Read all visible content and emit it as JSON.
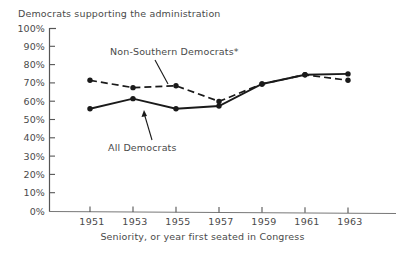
{
  "chart_data": {
    "type": "line",
    "title": "Democrats supporting the administration",
    "xlabel": "Seniority, or year first seated in Congress",
    "ylabel": "",
    "categories": [
      "1951",
      "1953",
      "1955",
      "1957",
      "1959",
      "1961",
      "1963"
    ],
    "x": [
      1951,
      1953,
      1955,
      1957,
      1959,
      1961,
      1963
    ],
    "ylim": [
      0,
      100
    ],
    "ytick_labels": [
      "0%",
      "10%",
      "20%",
      "30%",
      "40%",
      "50%",
      "60%",
      "70%",
      "80%",
      "90%",
      "100%"
    ],
    "ytick_values": [
      0,
      10,
      20,
      30,
      40,
      50,
      60,
      70,
      80,
      90,
      100
    ],
    "grid": false,
    "legend_position": "inline-annotations",
    "series": [
      {
        "name": "Non-Southern Democrats*",
        "style": "dashed",
        "marker": "filled-circle",
        "values": [
          71.5,
          67.5,
          68.5,
          60.0,
          69.5,
          74.5,
          71.5
        ]
      },
      {
        "name": "All Democrats",
        "style": "solid",
        "marker": "filled-circle",
        "values": [
          56.0,
          61.5,
          56.0,
          57.5,
          69.5,
          74.5,
          75.0
        ]
      }
    ],
    "annotations": [
      {
        "text": "Non-Southern Democrats*",
        "target_series": "Non-Southern Democrats*",
        "target_x": "1955"
      },
      {
        "text": "All Democrats",
        "target_series": "All Democrats",
        "target_x": "1953"
      }
    ]
  },
  "colors": {
    "ink": "#1a1a1a",
    "text": "#4a4a4a",
    "axis": "#555555",
    "background": "#ffffff"
  }
}
